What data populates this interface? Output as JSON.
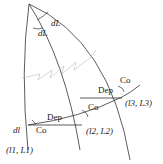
{
  "diagram": {
    "labels": {
      "dL_top": "dL",
      "dL_left": "dL",
      "co_top": "Co",
      "dep_upper": "Dep",
      "co_mid": "Co",
      "point3": "(l3, L3)",
      "dep_lower": "Dep",
      "dl": "dl",
      "co_lower": "Co",
      "point2": "(l2, L2)",
      "point1": "(l1, L1)"
    },
    "colors": {
      "line": "#333333",
      "faint": "#bbbbbb"
    }
  }
}
